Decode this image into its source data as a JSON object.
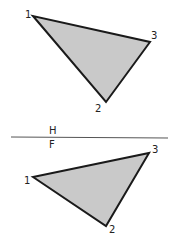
{
  "diagram": {
    "colors": {
      "fill": "#c9c9c9",
      "stroke": "#1a1a1a",
      "line": "#555555"
    },
    "fold_line": {
      "label_above": "H",
      "label_below": "F"
    },
    "top_view": {
      "vertices": [
        {
          "label": "1",
          "x": 33,
          "y": 16
        },
        {
          "label": "2",
          "x": 106,
          "y": 102
        },
        {
          "label": "3",
          "x": 150,
          "y": 42
        }
      ]
    },
    "front_view": {
      "vertices": [
        {
          "label": "1",
          "x": 33,
          "y": 177
        },
        {
          "label": "2",
          "x": 106,
          "y": 226
        },
        {
          "label": "3",
          "x": 149,
          "y": 153
        }
      ]
    }
  }
}
